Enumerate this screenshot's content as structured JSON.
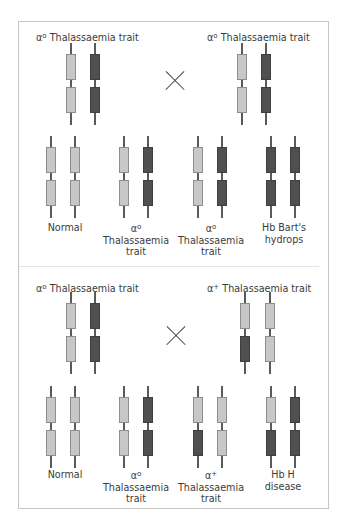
{
  "colors": {
    "normal_gene": "#c7c7c7",
    "deleted_gene": "#505050",
    "stem": "#5a5a5a",
    "border": "#c4c4c4"
  },
  "legend": {
    "light_block": "functional alpha-globin gene",
    "dark_block": "deleted alpha-globin gene"
  },
  "cross_symbol": "×",
  "cross1": {
    "parent_left": {
      "greek": "α",
      "sup": "o",
      "name": "Thalassaemia trait",
      "chromosomes": [
        [
          "light",
          "light"
        ],
        [
          "dark",
          "dark"
        ]
      ]
    },
    "parent_right": {
      "greek": "α",
      "sup": "o",
      "name": "Thalassaemia trait",
      "chromosomes": [
        [
          "light",
          "light"
        ],
        [
          "dark",
          "dark"
        ]
      ]
    },
    "offspring": [
      {
        "line1": "Normal",
        "line2": "",
        "line3": "",
        "chromosomes": [
          [
            "light",
            "light"
          ],
          [
            "light",
            "light"
          ]
        ]
      },
      {
        "line1": "αo",
        "greek": "α",
        "sup": "o",
        "line2": "Thalassaemia",
        "line3": "trait",
        "chromosomes": [
          [
            "light",
            "light"
          ],
          [
            "dark",
            "dark"
          ]
        ]
      },
      {
        "line1": "αo",
        "greek": "α",
        "sup": "o",
        "line2": "Thalassaemia",
        "line3": "trait",
        "chromosomes": [
          [
            "light",
            "light"
          ],
          [
            "dark",
            "dark"
          ]
        ]
      },
      {
        "line1": "Hb Bart's",
        "line2": "hydrops",
        "line3": "",
        "chromosomes": [
          [
            "dark",
            "dark"
          ],
          [
            "dark",
            "dark"
          ]
        ]
      }
    ]
  },
  "cross2": {
    "parent_left": {
      "greek": "α",
      "sup": "o",
      "name": "Thalassaemia trait",
      "chromosomes": [
        [
          "light",
          "light"
        ],
        [
          "dark",
          "dark"
        ]
      ]
    },
    "parent_right": {
      "greek": "α",
      "sup": "+",
      "name": "Thalassaemia trait",
      "chromosomes": [
        [
          "light",
          "dark"
        ],
        [
          "light",
          "light"
        ]
      ]
    },
    "offspring": [
      {
        "line1": "Normal",
        "line2": "",
        "line3": "",
        "chromosomes": [
          [
            "light",
            "light"
          ],
          [
            "light",
            "light"
          ]
        ]
      },
      {
        "line1": "αo",
        "greek": "α",
        "sup": "o",
        "line2": "Thalassaemia",
        "line3": "trait",
        "chromosomes": [
          [
            "light",
            "light"
          ],
          [
            "dark",
            "dark"
          ]
        ]
      },
      {
        "line1": "α+",
        "greek": "α",
        "sup": "+",
        "line2": "Thalassaemia",
        "line3": "trait",
        "chromosomes": [
          [
            "light",
            "dark"
          ],
          [
            "light",
            "light"
          ]
        ]
      },
      {
        "line1": "Hb H",
        "line2": "disease",
        "line3": "",
        "chromosomes": [
          [
            "light",
            "dark"
          ],
          [
            "dark",
            "dark"
          ]
        ]
      }
    ]
  }
}
